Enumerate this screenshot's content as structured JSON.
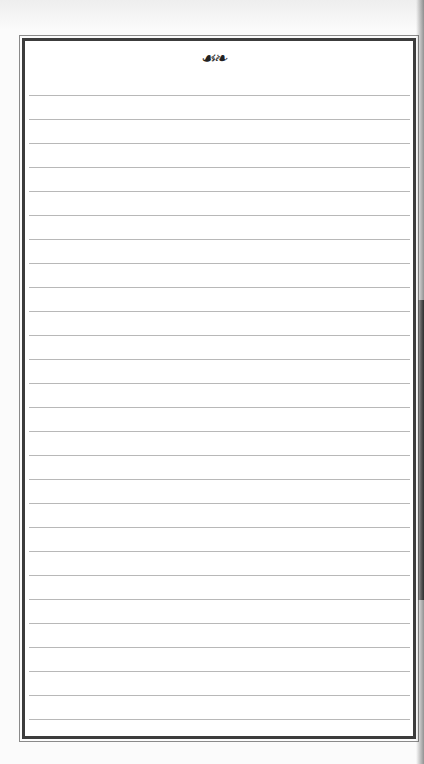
{
  "page": {
    "type": "lined notepaper",
    "ornament": "☙❧",
    "ornament_name": "fleuron-ornament",
    "line_count": 27,
    "first_line_y": 95,
    "line_spacing": 24,
    "colors": {
      "paper": "#ffffff",
      "border": "#3c3c3c",
      "rule": "#b8b8b8"
    }
  }
}
